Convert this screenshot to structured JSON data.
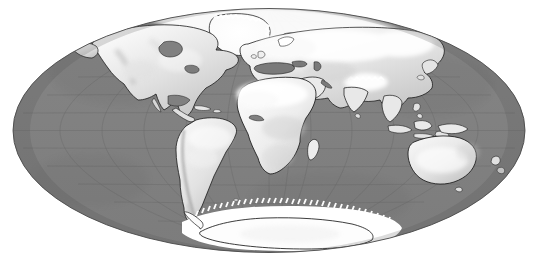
{
  "figure": {
    "kind": "world-map",
    "projection": "Mollweide",
    "title": "",
    "background_color": "#ffffff",
    "width": 538,
    "height": 261
  },
  "map": {
    "ocean_color": "#808080",
    "ocean_shade_dark": "#6f6f6f",
    "land_color": "#f2f2f2",
    "land_shade_light": "#ffffff",
    "land_shade_mid": "#d8d8d8",
    "land_shade_dark": "#a8a8a8",
    "coastline_color": "#1a1a1a",
    "graticule_color": "#6a6a6a",
    "ice_color": "#ffffff",
    "ellipse": {
      "center_x": 269,
      "center_y": 130.5,
      "radius_x": 256,
      "radius_y": 122
    },
    "graticule": {
      "meridian_step_deg": 30,
      "parallel_step_deg": 15,
      "meridian_count": 11,
      "parallel_count": 11,
      "visible": true
    },
    "landmasses": [
      {
        "name": "north-america",
        "label": "North America"
      },
      {
        "name": "greenland",
        "label": "Greenland"
      },
      {
        "name": "south-america",
        "label": "South America"
      },
      {
        "name": "africa",
        "label": "Africa"
      },
      {
        "name": "madagascar",
        "label": "Madagascar"
      },
      {
        "name": "eurasia",
        "label": "Eurasia"
      },
      {
        "name": "arabia",
        "label": "Arabian Peninsula"
      },
      {
        "name": "india",
        "label": "India"
      },
      {
        "name": "southeast-asia",
        "label": "Southeast Asia"
      },
      {
        "name": "japan",
        "label": "Japan"
      },
      {
        "name": "indonesia",
        "label": "Indonesia"
      },
      {
        "name": "new-guinea",
        "label": "New Guinea"
      },
      {
        "name": "australia",
        "label": "Australia"
      },
      {
        "name": "new-zealand",
        "label": "New Zealand"
      },
      {
        "name": "antarctica",
        "label": "Antarctica"
      },
      {
        "name": "british-isles",
        "label": "British Isles"
      },
      {
        "name": "iceland",
        "label": "Iceland"
      },
      {
        "name": "cuba",
        "label": "Caribbean"
      },
      {
        "name": "sri-lanka",
        "label": "Sri Lanka"
      },
      {
        "name": "philippines",
        "label": "Philippines"
      }
    ],
    "ice_regions": [
      {
        "name": "antarctic-ice-shelf",
        "label": "Antarctic Ice Shelf"
      },
      {
        "name": "greenland-ice-sheet",
        "label": "Greenland Ice Sheet"
      },
      {
        "name": "arctic-snow-cover",
        "label": "Northern Snow Cover"
      }
    ]
  }
}
